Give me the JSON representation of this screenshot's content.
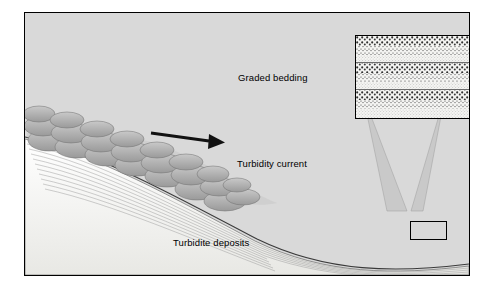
{
  "figure": {
    "background_color": "#d9d9d9",
    "border_color": "#000000",
    "labels": {
      "graded_bedding": "Graded bedding",
      "turbidity_current": "Turbidity current",
      "turbidite_deposits": "Turbidite deposits"
    },
    "elements": {
      "arrow_name": "flow-direction-arrow",
      "inset_name": "graded-bedding-inset",
      "callout_rect_name": "inset-source-rectangle",
      "seafloor_name": "seafloor-slope",
      "current_head_name": "turbidity-current-lobes",
      "deposit_layers_name": "turbidite-layer-stack",
      "substrate_name": "dark-substrate"
    },
    "colors": {
      "panel_gray": "#d9d9d9",
      "current_gray": "#a9a9a9",
      "substrate_dark": "#8a8a8a",
      "deposit_light": "#f4f4f2",
      "inset_fill": "#f2f2f2",
      "stipple": "#3a3a3a"
    }
  }
}
